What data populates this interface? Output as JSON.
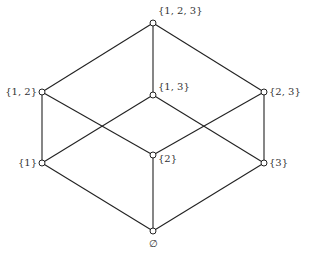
{
  "diagram": {
    "nodes": [
      {
        "id": "top",
        "label": "{1, 2, 3}",
        "x": 153,
        "y": 23,
        "lx": 158,
        "ly": 14,
        "anchor": "start"
      },
      {
        "id": "s12",
        "label": "{1, 2}",
        "x": 42,
        "y": 92,
        "lx": 37,
        "ly": 95,
        "anchor": "end"
      },
      {
        "id": "s13",
        "label": "{1, 3}",
        "x": 153,
        "y": 95,
        "lx": 158,
        "ly": 90,
        "anchor": "start"
      },
      {
        "id": "s23",
        "label": "{2, 3}",
        "x": 264,
        "y": 92,
        "lx": 269,
        "ly": 95,
        "anchor": "start"
      },
      {
        "id": "s1",
        "label": "{1}",
        "x": 42,
        "y": 163,
        "lx": 37,
        "ly": 166,
        "anchor": "end"
      },
      {
        "id": "s2",
        "label": "{2}",
        "x": 153,
        "y": 155,
        "lx": 158,
        "ly": 162,
        "anchor": "start"
      },
      {
        "id": "s3",
        "label": "{3}",
        "x": 264,
        "y": 163,
        "lx": 269,
        "ly": 166,
        "anchor": "start"
      },
      {
        "id": "empty",
        "label": "∅",
        "x": 153,
        "y": 231,
        "lx": 153,
        "ly": 247,
        "anchor": "middle"
      }
    ],
    "edges": [
      [
        "top",
        "s12"
      ],
      [
        "top",
        "s13"
      ],
      [
        "top",
        "s23"
      ],
      [
        "s12",
        "s1"
      ],
      [
        "s12",
        "s2"
      ],
      [
        "s13",
        "s1"
      ],
      [
        "s13",
        "s3"
      ],
      [
        "s23",
        "s2"
      ],
      [
        "s23",
        "s3"
      ],
      [
        "s1",
        "empty"
      ],
      [
        "s2",
        "empty"
      ],
      [
        "s3",
        "empty"
      ]
    ]
  }
}
